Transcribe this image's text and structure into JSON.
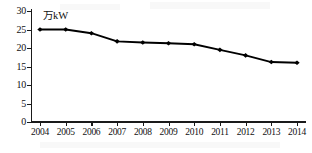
{
  "chart_data": {
    "type": "line",
    "title": "",
    "xlabel": "",
    "ylabel": "万kW",
    "unit_label": "万kW",
    "categories": [
      "2004",
      "2005",
      "2006",
      "2007",
      "2008",
      "2009",
      "2010",
      "2011",
      "2012",
      "2013",
      "2014"
    ],
    "values": [
      25,
      25,
      24,
      21.8,
      21.5,
      21.3,
      21,
      19.5,
      18,
      16.2,
      16
    ],
    "series": [
      {
        "name": "装机容量",
        "values": [
          25,
          25,
          24,
          21.8,
          21.5,
          21.3,
          21,
          19.5,
          18,
          16.2,
          16
        ]
      }
    ],
    "ylim": [
      0,
      30
    ],
    "ytick_values": [
      0,
      5,
      10,
      15,
      20,
      25,
      30
    ],
    "ytick_labels": [
      "0",
      "5",
      "10",
      "15",
      "20",
      "25",
      "30"
    ],
    "grid": false,
    "legend": "none",
    "marker": "diamond",
    "line_color": "#000000",
    "marker_color": "#000000"
  }
}
